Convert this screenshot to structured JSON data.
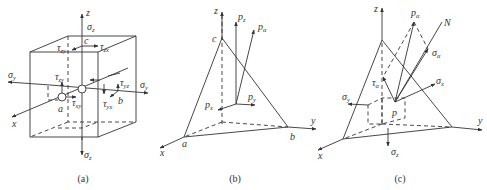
{
  "figure": {
    "panels": [
      {
        "caption": "(a)",
        "description": "Stress cube element",
        "labels": {
          "z_axis": "z",
          "x_axis": "x",
          "y_axis": "y",
          "sigma_z_top": "σ",
          "sigma_z_top_sub": "z",
          "sigma_z_bottom": "σ",
          "sigma_z_bottom_sub": "z",
          "sigma_y_left": "σ",
          "sigma_y_left_sub": "y",
          "sigma_y_right": "σ",
          "sigma_y_right_sub": "y",
          "tau_zx": "τ",
          "tau_zx_sub": "zx",
          "tau_zy_top": "τ",
          "tau_zy_top_sub": "zy",
          "tau_zy": "τ",
          "tau_zy_sub": "zy",
          "tau_xy": "τ",
          "tau_xy_sub": "xy",
          "tau_yz": "τ",
          "tau_yz_sub": "yz",
          "tau_yx": "τ",
          "tau_yx_sub": "yx",
          "point_a": "a",
          "point_b": "b",
          "point_c": "c"
        }
      },
      {
        "caption": "(b)",
        "description": "Tetrahedron with traction components",
        "labels": {
          "z_axis": "z",
          "x_axis": "x",
          "y_axis": "y",
          "p_z": "p",
          "p_z_sub": "z",
          "p_alpha": "p",
          "p_alpha_sub": "α",
          "p_x": "p",
          "p_x_sub": "x",
          "p_y": "p",
          "p_y_sub": "y",
          "point_a": "a",
          "point_b": "b",
          "point_c": "c"
        }
      },
      {
        "caption": "(c)",
        "description": "Tetrahedron with normal and shear stress decomposition",
        "labels": {
          "z_axis": "z",
          "x_axis": "x",
          "y_axis": "y",
          "p_alpha": "p",
          "p_alpha_sub": "α",
          "normal": "N",
          "sigma_alpha": "σ",
          "sigma_alpha_sub": "α",
          "tau_alpha": "τ",
          "tau_alpha_sub": "α",
          "sigma_x": "σ",
          "sigma_x_sub": "x",
          "sigma_y": "σ",
          "sigma_y_sub": "y",
          "sigma_z": "σ",
          "sigma_z_sub": "z",
          "point_p": "p"
        }
      }
    ]
  }
}
